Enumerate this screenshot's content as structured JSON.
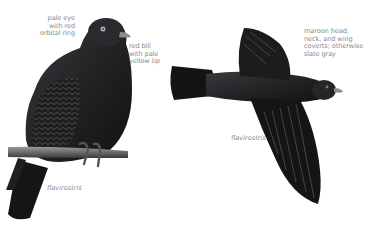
{
  "plate": {
    "background": "#ffffff",
    "plumage_dark": "#1c1c1e",
    "plumage_mid": "#3a3a3e",
    "feather_highlight": "#6e6e72",
    "label_color": "#8a8a8a"
  },
  "perched_bird": {
    "species_label": "flavirostris",
    "annotations": [
      {
        "id": "eye",
        "lines": [
          "pale eye",
          "with red",
          "orbital ring"
        ]
      },
      {
        "id": "bill",
        "lines": [
          "red bill",
          "with pale",
          "yellow tip"
        ]
      }
    ]
  },
  "flying_bird": {
    "species_label": "flavirostris",
    "annotations": [
      {
        "id": "plumage",
        "lines": [
          "maroon head,",
          "neck, and wing",
          "coverts; otherwise",
          "slate gray"
        ]
      }
    ]
  }
}
